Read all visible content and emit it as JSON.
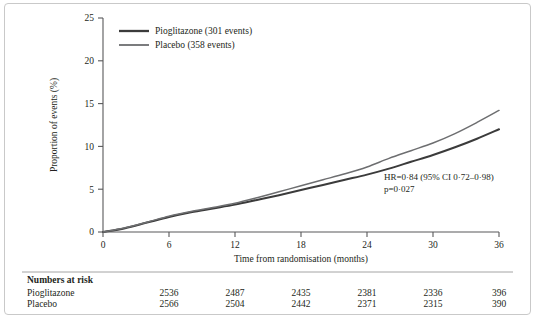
{
  "figure": {
    "background_color": "#ffffff",
    "frame_color": "#c9c9c9",
    "axis_color": "#58585a",
    "text_color": "#231f20"
  },
  "chart_data": {
    "type": "line",
    "title": "",
    "subtitle": "",
    "xlabel": "Time from randomisation (months)",
    "ylabel": "Proportion of events (%)",
    "xlim": [
      0,
      36
    ],
    "ylim": [
      0,
      25
    ],
    "xticks": [
      0,
      6,
      12,
      18,
      24,
      30,
      36
    ],
    "xtick_labels": [
      "0",
      "6",
      "12",
      "18",
      "24",
      "30",
      "36"
    ],
    "yticks": [
      0,
      5,
      10,
      15,
      20,
      25
    ],
    "ytick_labels": [
      "0",
      "5",
      "10",
      "15",
      "20",
      "25"
    ],
    "grid": false,
    "legend_position": "top-left-inside",
    "x": [
      0,
      2,
      4,
      6,
      8,
      10,
      12,
      14,
      16,
      18,
      20,
      22,
      24,
      26,
      28,
      30,
      32,
      34,
      36
    ],
    "series": [
      {
        "name": "Pioglitazone (301 events)",
        "short_name": "Pioglitazone",
        "events": 301,
        "color": "#3b3b3b",
        "line_width": 2.0,
        "values": [
          0.0,
          0.45,
          1.1,
          1.75,
          2.3,
          2.75,
          3.2,
          3.75,
          4.3,
          4.9,
          5.5,
          6.1,
          6.7,
          7.4,
          8.2,
          9.0,
          9.9,
          10.9,
          12.0
        ]
      },
      {
        "name": "Placebo (358 events)",
        "short_name": "Placebo",
        "events": 358,
        "color": "#6d6e70",
        "line_width": 1.5,
        "values": [
          0.0,
          0.5,
          1.15,
          1.85,
          2.4,
          2.85,
          3.35,
          4.0,
          4.7,
          5.4,
          6.1,
          6.8,
          7.6,
          8.6,
          9.5,
          10.4,
          11.5,
          12.8,
          14.2
        ]
      }
    ],
    "annotations": [
      {
        "name": "hazard-ratio",
        "line1": "HR=0·84 (95% CI 0·72–0·98)",
        "line2": "p=0·027",
        "x_month": 25.5,
        "y_percent": 6.6
      }
    ]
  },
  "legend": {
    "items": [
      {
        "label": "Pioglitazone (301 events)"
      },
      {
        "label": "Placebo (358 events)"
      }
    ]
  },
  "risk_table": {
    "heading": "Numbers at risk",
    "columns": [
      "0",
      "6",
      "12",
      "18",
      "24",
      "30",
      "36"
    ],
    "rows": [
      {
        "label": "Pioglitazone",
        "values": [
          "",
          "2536",
          "2487",
          "2435",
          "2381",
          "2336",
          "396"
        ]
      },
      {
        "label": "Placebo",
        "values": [
          "",
          "2566",
          "2504",
          "2442",
          "2371",
          "2315",
          "390"
        ]
      }
    ]
  }
}
